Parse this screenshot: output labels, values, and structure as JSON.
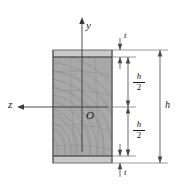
{
  "figure": {
    "type": "engineering-cross-section-diagram",
    "colors": {
      "section_fill": "#a9a9a9",
      "flange_fill": "#c8c8c8",
      "outline": "#2b2b2b",
      "grain": "#8a8a8a",
      "dimension_line": "#4a4a4a",
      "axis_line": "#3a3a3a",
      "background": "#ffffff"
    },
    "labels": {
      "y_axis": "y",
      "z_axis": "z",
      "origin": "O",
      "thickness_top": "t",
      "thickness_bottom": "t",
      "half_depth_upper_num": "h",
      "half_depth_upper_den": "2",
      "half_depth_lower_num": "h",
      "half_depth_lower_den": "2",
      "total_depth": "h"
    },
    "geometry": {
      "section_left_px": 53,
      "section_right_px": 112,
      "section_top_px": 50,
      "section_bottom_px": 163,
      "flange_top_inner_px": 57,
      "flange_bottom_inner_px": 156,
      "origin_x_px": 82,
      "origin_y_px": 107,
      "dim_half_x_px": 128,
      "dim_total_x_px": 160,
      "dim_t_x_px": 120
    }
  }
}
